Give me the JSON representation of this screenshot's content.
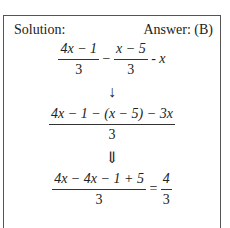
{
  "header": {
    "solution_label": "Solution:",
    "answer_label": "Answer: (B)"
  },
  "step1": {
    "frac1": {
      "num": "4x − 1",
      "den": "3"
    },
    "minus": "−",
    "frac2": {
      "num": "x − 5",
      "den": "3"
    },
    "tail": "- x"
  },
  "arrow1": "↓",
  "step2": {
    "num": "4x − 1 − (x − 5) − 3x",
    "den": "3"
  },
  "arrow2": "⇓",
  "step3": {
    "frac1": {
      "num": "4x − 4x − 1 + 5",
      "den": "3"
    },
    "equals": "=",
    "frac2": {
      "num": "4",
      "den": "3"
    }
  }
}
